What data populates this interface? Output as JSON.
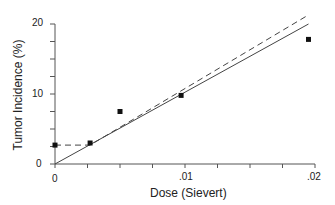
{
  "chart_data": {
    "type": "scatter",
    "title": "",
    "xlabel": "Dose (Sievert)",
    "ylabel": "Tumor Incidence (%)",
    "xlim": [
      0,
      0.02
    ],
    "ylim": [
      0,
      20
    ],
    "x_ticks": [
      "0",
      ".01",
      ".02"
    ],
    "y_ticks": [
      "0",
      "10",
      "20"
    ],
    "grid": false,
    "series": [
      {
        "name": "Observed",
        "kind": "points",
        "marker": "square",
        "x": [
          0,
          0.0027,
          0.005,
          0.0097,
          0.0195
        ],
        "y": [
          2.7,
          3.0,
          7.5,
          9.8,
          17.8
        ]
      },
      {
        "name": "Linear fit (solid)",
        "kind": "line",
        "style": "solid",
        "x": [
          0,
          0.0195
        ],
        "y": [
          0,
          20.0
        ]
      },
      {
        "name": "Linear fit (dashed)",
        "kind": "line",
        "style": "dashed",
        "x": [
          0,
          0.0027,
          0.0195
        ],
        "y": [
          2.7,
          2.7,
          21.3
        ]
      }
    ]
  }
}
